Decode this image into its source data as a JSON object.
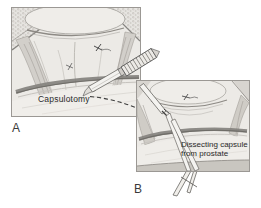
{
  "figure": {
    "panel_a": {
      "letter": "A",
      "annotation": "Capsulotomy"
    },
    "panel_b": {
      "letter": "B",
      "annotation": "Dissecting capsule from prostate"
    },
    "colors": {
      "paper": "#ffffff",
      "panel_background": "#eceae6",
      "panel_border": "#9b9894",
      "dark_band": "#6e6c67",
      "tissue_mid": "#d2cfca",
      "annotation_text": "#2b2b2b",
      "letter_text": "#3a3a3a"
    }
  }
}
